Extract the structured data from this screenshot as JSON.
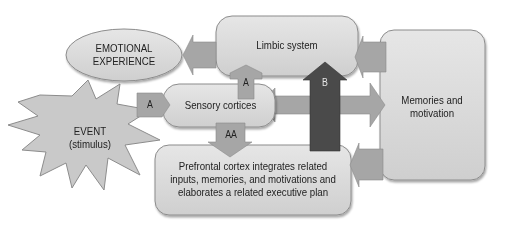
{
  "nodes": {
    "emotional_experience": {
      "line1": "EMOTIONAL",
      "line2": "EXPERIENCE"
    },
    "limbic_system": {
      "label": "Limbic system"
    },
    "event": {
      "line1": "EVENT",
      "line2": "(stimulus)"
    },
    "sensory_cortices": {
      "label": "Sensory cortices"
    },
    "memories_motivation": {
      "line1": "Memories and",
      "line2": "motivation"
    },
    "prefrontal_cortex": {
      "line1": "Prefrontal cortex integrates related",
      "line2": "inputs, memories, and motivations and",
      "line3": "elaborates a related executive plan"
    }
  },
  "arrows": {
    "event_to_sensory": "A",
    "sensory_to_limbic": "A",
    "sensory_to_prefrontal": "AA",
    "prefrontal_to_limbic": "B"
  },
  "colors": {
    "box_fill": "#d9d9d9",
    "box_stroke": "#8c8c8c",
    "arrow_fill": "#a6a6a6",
    "arrow_dark": "#4a4a4a",
    "text": "#222222"
  }
}
